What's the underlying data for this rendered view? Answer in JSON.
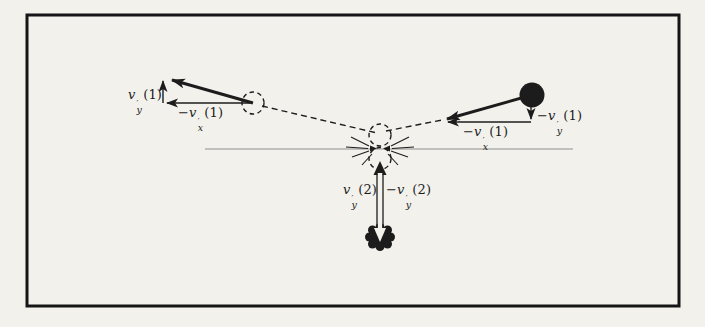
{
  "figure": {
    "background": "#f2f1ec",
    "frame_color": "#151515",
    "ink_color": "#1c1c1c",
    "baseline_color": "#8f8f8f"
  },
  "labels": {
    "left_vy": {
      "sign": "",
      "base": "v",
      "prime": "′",
      "sub": "y",
      "arg": "(1)"
    },
    "left_vx": {
      "sign": "−",
      "base": "v",
      "prime": "′",
      "sub": "x",
      "arg": "(1)"
    },
    "right_vy": {
      "sign": "−",
      "base": "v",
      "prime": "′",
      "sub": "y",
      "arg": "(1)"
    },
    "right_vx": {
      "sign": "−",
      "base": "v",
      "prime": "′",
      "sub": "x",
      "arg": "(1)"
    },
    "bottom_vy": {
      "sign": "",
      "base": "v",
      "prime": "′",
      "sub": "y",
      "arg": "(2)"
    },
    "bottom_neg_vy": {
      "sign": "−",
      "base": "v",
      "prime": "′",
      "sub": "y",
      "arg": "(2)"
    }
  }
}
